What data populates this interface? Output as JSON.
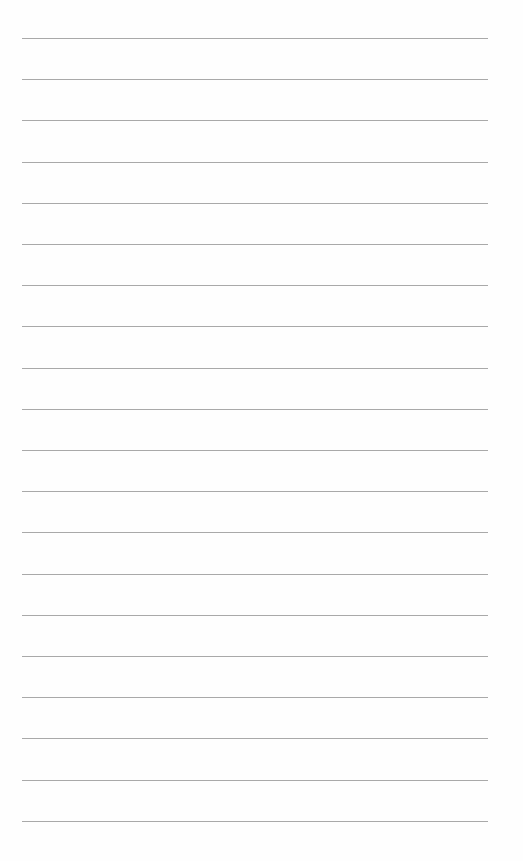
{
  "page": {
    "type": "lined-paper",
    "background_color": "#fefefe",
    "line_color": "#a9a9a9",
    "line_count": 20,
    "first_line_y": 38,
    "line_spacing": 41.2,
    "line_left": 22,
    "line_width": 466,
    "text": []
  }
}
